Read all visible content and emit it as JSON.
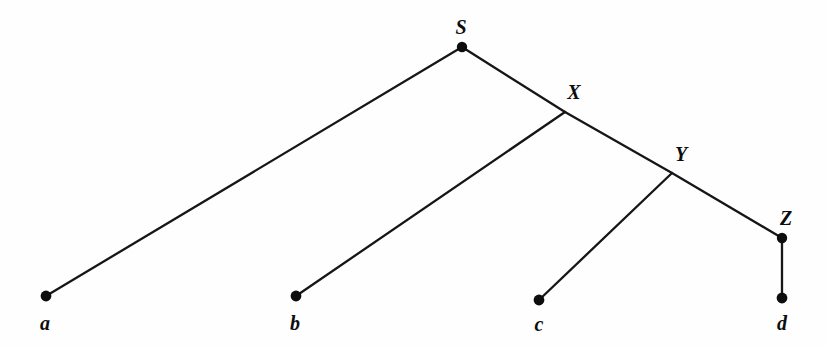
{
  "diagram": {
    "kind": "tree-diagram",
    "background_color": "#fefefe",
    "line_color": "#161616",
    "node_color": "#0d0d0d",
    "width": 827,
    "height": 346,
    "nodes": [
      {
        "id": "S",
        "label": "S",
        "type": "internal",
        "x": 462,
        "y": 47,
        "dot": true,
        "dot_r": 5.2,
        "label_x": 461,
        "label_y": 34
      },
      {
        "id": "X",
        "label": "X",
        "type": "internal",
        "x": 565,
        "y": 112,
        "dot": false,
        "dot_r": 0,
        "label_x": 574,
        "label_y": 99
      },
      {
        "id": "Y",
        "label": "Y",
        "type": "internal",
        "x": 672,
        "y": 173,
        "dot": false,
        "dot_r": 0,
        "label_x": 681,
        "label_y": 161
      },
      {
        "id": "Z",
        "label": "Z",
        "type": "internal",
        "x": 782,
        "y": 238,
        "dot": true,
        "dot_r": 5.2,
        "label_x": 786,
        "label_y": 225
      },
      {
        "id": "a",
        "label": "a",
        "type": "leaf",
        "x": 46,
        "y": 296,
        "dot": true,
        "dot_r": 5.4,
        "label_x": 45,
        "label_y": 330
      },
      {
        "id": "b",
        "label": "b",
        "type": "leaf",
        "x": 296,
        "y": 296,
        "dot": true,
        "dot_r": 5.4,
        "label_x": 295,
        "label_y": 330
      },
      {
        "id": "c",
        "label": "c",
        "type": "leaf",
        "x": 539,
        "y": 300,
        "dot": true,
        "dot_r": 5.4,
        "label_x": 539,
        "label_y": 331
      },
      {
        "id": "d",
        "label": "d",
        "type": "leaf",
        "x": 782,
        "y": 298,
        "dot": true,
        "dot_r": 5.4,
        "label_x": 782,
        "label_y": 330
      }
    ],
    "edges": [
      {
        "id": "edge-S-a",
        "from": "S",
        "to": "a",
        "x1": 462,
        "y1": 47,
        "x2": 46,
        "y2": 296
      },
      {
        "id": "edge-S-X",
        "from": "S",
        "to": "X",
        "x1": 462,
        "y1": 47,
        "x2": 565,
        "y2": 112
      },
      {
        "id": "edge-X-b",
        "from": "X",
        "to": "b",
        "x1": 565,
        "y1": 112,
        "x2": 296,
        "y2": 296
      },
      {
        "id": "edge-X-Y",
        "from": "X",
        "to": "Y",
        "x1": 565,
        "y1": 112,
        "x2": 672,
        "y2": 173
      },
      {
        "id": "edge-Y-c",
        "from": "Y",
        "to": "c",
        "x1": 672,
        "y1": 173,
        "x2": 539,
        "y2": 300
      },
      {
        "id": "edge-Y-Z",
        "from": "Y",
        "to": "Z",
        "x1": 672,
        "y1": 173,
        "x2": 782,
        "y2": 238
      },
      {
        "id": "edge-Z-d",
        "from": "Z",
        "to": "d",
        "x1": 782,
        "y1": 238,
        "x2": 782,
        "y2": 298
      }
    ]
  }
}
